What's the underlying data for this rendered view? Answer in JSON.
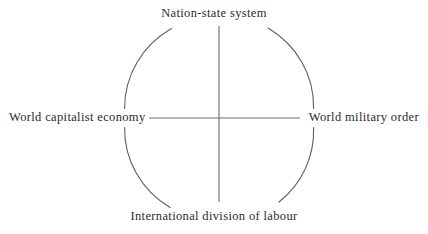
{
  "diagram": {
    "type": "four-quadrant-conceptual",
    "title": "",
    "geometry": {
      "center_x": 219,
      "center_y": 118,
      "ellipse_rx": 95,
      "ellipse_ry": 92,
      "axis_color": "#6a6a6a",
      "ellipse_color": "#5e5e5e",
      "text_color": "#2b2b2b",
      "background_color": "#ffffff"
    },
    "nodes": [
      {
        "id": "top",
        "position": "north",
        "label": "Nation-state system"
      },
      {
        "id": "right",
        "position": "east",
        "label": "World military order"
      },
      {
        "id": "bottom",
        "position": "south",
        "label": "International division of labour"
      },
      {
        "id": "left",
        "position": "west",
        "label": "World capitalist economy"
      }
    ],
    "connectors": [
      {
        "id": "vertical-axis",
        "from": "top",
        "to": "bottom"
      },
      {
        "id": "horizontal-axis",
        "from": "left",
        "to": "right"
      },
      {
        "id": "enclosing-ellipse",
        "from": "top",
        "to": "top"
      }
    ]
  }
}
